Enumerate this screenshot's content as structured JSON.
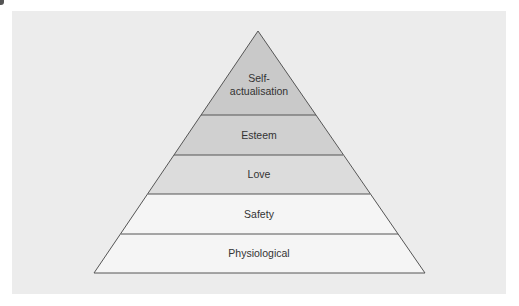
{
  "diagram": {
    "type": "pyramid",
    "levels": [
      {
        "label_line1": "Self-",
        "label_line2": "actualisation",
        "fill": "#c9c9c9"
      },
      {
        "label": "Esteem",
        "fill": "#d0d0d0"
      },
      {
        "label": "Love",
        "fill": "#dcdcdc"
      },
      {
        "label": "Safety",
        "fill": "#f5f5f5"
      },
      {
        "label": "Physiological",
        "fill": "#f5f5f5"
      }
    ],
    "stroke_color": "#555555",
    "background_color": "#ececec"
  }
}
